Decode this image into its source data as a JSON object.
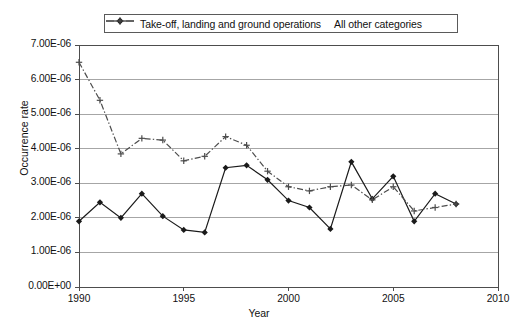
{
  "chart_data": {
    "type": "line",
    "title": "",
    "xlabel": "Year",
    "ylabel": "Occurrence rate",
    "xlim": [
      1990,
      2010
    ],
    "ylim": [
      0,
      7e-06
    ],
    "grid": "horizontal",
    "legend_position": "top-center",
    "x_ticks": [
      1990,
      1995,
      2000,
      2005,
      2010
    ],
    "x_tick_labels": [
      "1990",
      "1995",
      "2000",
      "2005",
      "2010"
    ],
    "y_ticks": [
      0,
      1e-06,
      2e-06,
      3e-06,
      4e-06,
      5e-06,
      6e-06,
      7e-06
    ],
    "y_tick_labels": [
      "0.00E+00",
      "1.00E-06",
      "2.00E-06",
      "3.00E-06",
      "4.00E-06",
      "5.00E-06",
      "6.00E-06",
      "7.00E-06"
    ],
    "series": [
      {
        "name": "Take-off, landing and ground operations",
        "marker": "diamond",
        "linestyle": "solid",
        "color": "#1a1a1a",
        "x": [
          1990,
          1991,
          1992,
          1993,
          1994,
          1995,
          1996,
          1997,
          1998,
          1999,
          2000,
          2001,
          2002,
          2003,
          2004,
          2005,
          2006,
          2007,
          2008
        ],
        "values": [
          1.9e-06,
          2.45e-06,
          2e-06,
          2.7e-06,
          2.05e-06,
          1.65e-06,
          1.58e-06,
          3.45e-06,
          3.52e-06,
          3.1e-06,
          2.5e-06,
          2.3e-06,
          1.68e-06,
          3.62e-06,
          2.55e-06,
          3.2e-06,
          1.9e-06,
          2.7e-06,
          2.4e-06
        ]
      },
      {
        "name": "All other categories",
        "marker": "plus",
        "linestyle": "dash-dot",
        "color": "#4d4d4d",
        "x": [
          1990,
          1991,
          1992,
          1993,
          1994,
          1995,
          1996,
          1997,
          1998,
          1999,
          2000,
          2001,
          2002,
          2003,
          2004,
          2005,
          2006,
          2007,
          2008
        ],
        "values": [
          6.5e-06,
          5.4e-06,
          3.85e-06,
          4.3e-06,
          4.25e-06,
          3.65e-06,
          3.78e-06,
          4.35e-06,
          4.1e-06,
          3.35e-06,
          2.9e-06,
          2.78e-06,
          2.9e-06,
          2.95e-06,
          2.52e-06,
          2.9e-06,
          2.2e-06,
          2.3e-06,
          2.4e-06
        ]
      }
    ]
  },
  "legend": {
    "items": [
      {
        "label": "Take-off, landing and ground operations",
        "marker": "diamond",
        "linestyle": "solid"
      },
      {
        "label": "All other categories",
        "marker": "plus",
        "linestyle": "dash-dot"
      }
    ]
  },
  "colors": {
    "series_primary": "#1a1a1a",
    "series_secondary": "#4d4d4d",
    "gridline": "#808080",
    "axis": "#4d4d4d",
    "background": "#ffffff"
  }
}
